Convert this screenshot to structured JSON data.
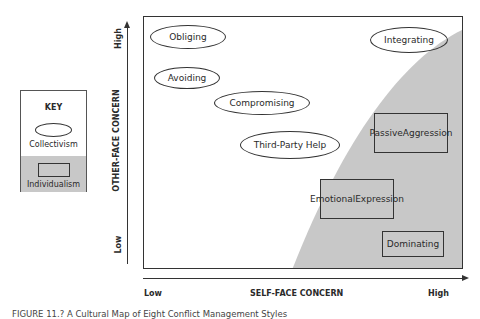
{
  "key": {
    "title": "KEY",
    "collectivism_label": "Collectivism",
    "individualism_label": "Individualism"
  },
  "y_axis": {
    "label": "OTHER-FACE CONCERN",
    "low": "Low",
    "high": "High"
  },
  "x_axis": {
    "label": "SELF-FACE CONCERN",
    "low": "Low",
    "high": "High"
  },
  "styles": {
    "collectivism": [
      {
        "label": "Obliging"
      },
      {
        "label": "Avoiding"
      },
      {
        "label": "Compromising"
      },
      {
        "label": "Third-Party Help"
      },
      {
        "label": "Integrating"
      }
    ],
    "individualism": [
      {
        "label_line1": "Passive",
        "label_line2": "Aggression"
      },
      {
        "label_line1": "Emotional",
        "label_line2": "Expression"
      },
      {
        "label": "Dominating"
      }
    ]
  },
  "colors": {
    "individualism_fill": "#c8c8c8",
    "line": "#333333"
  },
  "caption": "FIGURE 11.? A Cultural Map of Eight Conflict Management Styles"
}
